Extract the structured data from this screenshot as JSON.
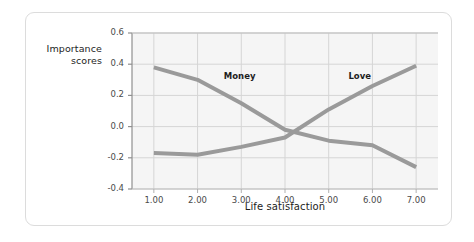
{
  "figure": {
    "card_background": "#ffffff",
    "border_color": "#dcdcdc"
  },
  "chart_data": {
    "type": "line",
    "title": "",
    "xlabel": "Life satisfaction",
    "ylabel": "Importance scores",
    "ylabel_line1": "Importance",
    "ylabel_line2": "scores",
    "x": [
      1.0,
      2.0,
      3.0,
      4.0,
      5.0,
      6.0,
      7.0
    ],
    "xticklabels": [
      "1.00",
      "2.00",
      "3.00",
      "4.00",
      "5.00",
      "6.00",
      "7.00"
    ],
    "yticks": [
      0.6,
      0.4,
      0.2,
      0.0,
      -0.2,
      -0.4
    ],
    "yticklabels": [
      "0.6",
      "0.4",
      "0.2",
      "0.0",
      "-0.2",
      "-0.4"
    ],
    "xlim": [
      0.5,
      7.5
    ],
    "ylim": [
      -0.4,
      0.6
    ],
    "grid": true,
    "legend_position": "inline-annotations",
    "plot_background": "#f5f5f5",
    "gridline_color": "#d5d5d5",
    "line_color": "#9a9a9a",
    "line_width": 4,
    "series": [
      {
        "name": "Money",
        "values": [
          0.38,
          0.3,
          0.15,
          -0.02,
          -0.09,
          -0.12,
          -0.26
        ],
        "annotation": "Money",
        "annotation_x": 2.6,
        "annotation_y": 0.32
      },
      {
        "name": "Love",
        "values": [
          -0.17,
          -0.18,
          -0.13,
          -0.07,
          0.11,
          0.26,
          0.39
        ],
        "annotation": "Love",
        "annotation_x": 5.45,
        "annotation_y": 0.32
      }
    ]
  }
}
